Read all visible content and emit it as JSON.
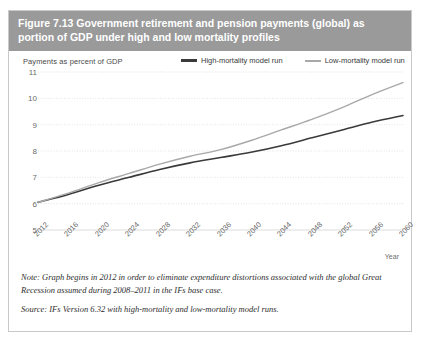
{
  "figure": {
    "title": "Figure 7.13 Government retirement and pension payments (global) as portion of GDP under high and low mortality profiles",
    "note": "Note: Graph begins in 2012 in order to eliminate expenditure distortions associated with the global Great Recession assumed during 2008–2011 in the IFs base case.",
    "source": "Source: IFs Version 6.32 with high-mortality and low-mortality model runs."
  },
  "colors": {
    "header_band": "#9a9a9a",
    "high_mortality": "#3a3a3a",
    "low_mortality": "#a8a8a8",
    "gridline": "#dcdcdc",
    "axis_text": "#6b6b6b"
  },
  "chart_data": {
    "type": "line",
    "title": "",
    "ylabel": "Payments as percent of GDP",
    "xlabel": "Year",
    "ylim": [
      5,
      11
    ],
    "yticks": [
      5,
      6,
      7,
      8,
      9,
      10,
      11
    ],
    "xlim": [
      2012,
      2060
    ],
    "xticks": [
      2012,
      2016,
      2020,
      2024,
      2028,
      2032,
      2036,
      2040,
      2044,
      2048,
      2052,
      2056,
      2060
    ],
    "grid": true,
    "legend_position": "top-right",
    "x": [
      2012,
      2016,
      2020,
      2024,
      2028,
      2032,
      2036,
      2040,
      2044,
      2048,
      2052,
      2056,
      2060
    ],
    "series": [
      {
        "name": "High-mortality model run",
        "color": "#3a3a3a",
        "values": [
          6.05,
          6.35,
          6.7,
          7.0,
          7.3,
          7.55,
          7.75,
          7.95,
          8.2,
          8.5,
          8.8,
          9.1,
          9.35
        ]
      },
      {
        "name": "Low-mortality model run",
        "color": "#a8a8a8",
        "values": [
          6.05,
          6.4,
          6.8,
          7.15,
          7.5,
          7.8,
          8.05,
          8.4,
          8.8,
          9.2,
          9.65,
          10.15,
          10.6
        ]
      }
    ]
  }
}
